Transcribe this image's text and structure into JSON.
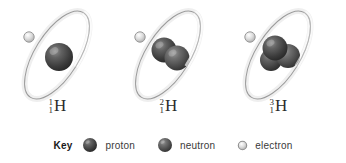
{
  "figure": {
    "background_color": "#ffffff"
  },
  "atoms": [
    {
      "id": "protium",
      "name": "protium",
      "mass_number": "1",
      "atomic_number": "1",
      "symbol": "H",
      "protons": 1,
      "neutrons": 0,
      "electrons": 1
    },
    {
      "id": "deuterium",
      "name": "deuterium",
      "mass_number": "2",
      "atomic_number": "1",
      "symbol": "H",
      "protons": 1,
      "neutrons": 1,
      "electrons": 1
    },
    {
      "id": "tritium",
      "name": "tritium",
      "mass_number": "3",
      "atomic_number": "1",
      "symbol": "H",
      "protons": 1,
      "neutrons": 2,
      "electrons": 1
    }
  ],
  "legend": {
    "title": "Key",
    "items": [
      {
        "icon": "proton-sphere-icon",
        "label": "proton",
        "color": "#4a4a4a"
      },
      {
        "icon": "neutron-sphere-icon",
        "label": "neutron",
        "color": "#5a5a5a"
      },
      {
        "icon": "electron-circle-icon",
        "label": "electron",
        "color": "#d6d6d6"
      }
    ]
  },
  "colors": {
    "proton": "#4a4a4a",
    "neutron": "#5a5a5a",
    "electron_fill": "#d9d9d9",
    "electron_stroke": "#9a9a9a",
    "orbit_stroke": "#9b9b9b",
    "orbit_band": "#f2f2f2",
    "label_text": "#2b2b2b",
    "legend_text": "#3a3a3a",
    "background": "#ffffff"
  }
}
